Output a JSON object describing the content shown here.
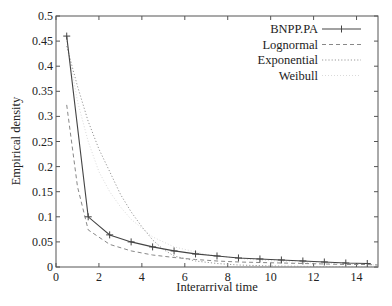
{
  "chart_data": {
    "type": "line",
    "title": "",
    "xlabel": "Interarrival time",
    "ylabel": "Empirical density",
    "xlim": [
      0,
      15
    ],
    "ylim": [
      0,
      0.5
    ],
    "grid": false,
    "legend_position": "upper right",
    "x_ticks": [
      0,
      2,
      4,
      6,
      8,
      10,
      12,
      14
    ],
    "y_ticks": [
      0,
      0.05,
      0.1,
      0.15,
      0.2,
      0.25,
      0.3,
      0.35,
      0.4,
      0.45,
      0.5
    ],
    "y_tick_labels": [
      "0",
      "0.05",
      "0.1",
      "0.15",
      "0.2",
      "0.25",
      "0.3",
      "0.35",
      "0.4",
      "0.45",
      "0.5"
    ],
    "series": [
      {
        "name": "BNPP.PA",
        "style": "solid-with-plus-markers",
        "color": "#444444",
        "x": [
          0.5,
          1.5,
          2.5,
          3.5,
          4.5,
          5.5,
          6.5,
          7.5,
          8.5,
          9.5,
          10.5,
          11.5,
          12.5,
          13.5,
          14.5
        ],
        "values": [
          0.46,
          0.1,
          0.064,
          0.05,
          0.04,
          0.032,
          0.026,
          0.022,
          0.018,
          0.016,
          0.014,
          0.012,
          0.01,
          0.008,
          0.007
        ]
      },
      {
        "name": "Lognormal",
        "style": "dashed",
        "color": "#888888",
        "x": [
          0.5,
          1.0,
          1.5,
          2.5,
          3.5,
          4.5,
          5.5,
          6.5,
          7.5,
          8.5,
          9.5,
          10.5,
          11.5,
          12.5,
          13.5,
          14.5,
          15
        ],
        "values": [
          0.323,
          0.16,
          0.074,
          0.045,
          0.032,
          0.024,
          0.019,
          0.015,
          0.012,
          0.01,
          0.009,
          0.008,
          0.007,
          0.006,
          0.005,
          0.005,
          0.004
        ]
      },
      {
        "name": "Exponential",
        "style": "dotted",
        "color": "#999999",
        "x": [
          0.5,
          1.0,
          1.5,
          2.0,
          2.5,
          3.0,
          3.5,
          4.0,
          4.5,
          5.0,
          5.5,
          6.5,
          7.5,
          8.5,
          10,
          12,
          15
        ],
        "values": [
          0.44,
          0.36,
          0.29,
          0.235,
          0.19,
          0.145,
          0.11,
          0.08,
          0.054,
          0.035,
          0.022,
          0.012,
          0.007,
          0.004,
          0.002,
          0.001,
          0.0
        ]
      },
      {
        "name": "Weibull",
        "style": "faint-dotted",
        "color": "#d0d0d0",
        "x": [
          0.5,
          1.0,
          1.5,
          2.0,
          2.5,
          3.0,
          3.5,
          4.5,
          5.5,
          7,
          9,
          12,
          15
        ],
        "values": [
          0.45,
          0.33,
          0.25,
          0.19,
          0.15,
          0.12,
          0.095,
          0.06,
          0.04,
          0.025,
          0.015,
          0.008,
          0.004
        ]
      }
    ]
  }
}
